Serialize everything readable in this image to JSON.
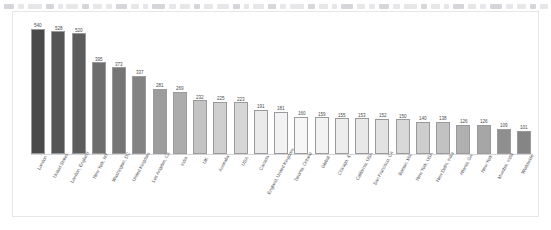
{
  "toolbar": {
    "ghost_segments": [
      {
        "x": 4,
        "w": 10
      },
      {
        "x": 18,
        "w": 6
      },
      {
        "x": 28,
        "w": 14
      },
      {
        "x": 46,
        "w": 8
      },
      {
        "x": 58,
        "w": 5
      },
      {
        "x": 66,
        "w": 12
      },
      {
        "x": 82,
        "w": 7
      },
      {
        "x": 93,
        "w": 9
      },
      {
        "x": 106,
        "w": 6
      },
      {
        "x": 116,
        "w": 11
      },
      {
        "x": 131,
        "w": 8
      },
      {
        "x": 143,
        "w": 5
      },
      {
        "x": 152,
        "w": 13
      },
      {
        "x": 169,
        "w": 7
      },
      {
        "x": 180,
        "w": 10
      },
      {
        "x": 194,
        "w": 6
      },
      {
        "x": 204,
        "w": 9
      },
      {
        "x": 217,
        "w": 12
      },
      {
        "x": 233,
        "w": 7
      },
      {
        "x": 244,
        "w": 5
      },
      {
        "x": 253,
        "w": 11
      },
      {
        "x": 268,
        "w": 8
      },
      {
        "x": 280,
        "w": 6
      },
      {
        "x": 290,
        "w": 14
      },
      {
        "x": 308,
        "w": 7
      },
      {
        "x": 319,
        "w": 9
      },
      {
        "x": 332,
        "w": 5
      },
      {
        "x": 341,
        "w": 12
      },
      {
        "x": 357,
        "w": 8
      },
      {
        "x": 369,
        "w": 6
      },
      {
        "x": 379,
        "w": 10
      },
      {
        "x": 393,
        "w": 7
      },
      {
        "x": 404,
        "w": 13
      },
      {
        "x": 421,
        "w": 6
      },
      {
        "x": 431,
        "w": 9
      },
      {
        "x": 444,
        "w": 5
      },
      {
        "x": 453,
        "w": 11
      },
      {
        "x": 468,
        "w": 8
      },
      {
        "x": 480,
        "w": 6
      },
      {
        "x": 490,
        "w": 12
      },
      {
        "x": 506,
        "w": 7
      },
      {
        "x": 517,
        "w": 9
      },
      {
        "x": 530,
        "w": 6
      },
      {
        "x": 540,
        "w": 8
      }
    ]
  },
  "chart_data": {
    "type": "bar",
    "title": "",
    "subtitle": "",
    "xlabel": "",
    "ylabel": "",
    "ylim": [
      0,
      560
    ],
    "grid": false,
    "legend": null,
    "orientation": "vertical",
    "value_labels_shown": true,
    "sort": "descending",
    "categories": [
      "London",
      "United States",
      "London, England",
      "New York, NY",
      "Washington, DC",
      "United Kingdom",
      "Los Angeles, CA",
      "India",
      "UK",
      "Australia",
      "USA",
      "Canada",
      "England, United Kingdom",
      "Toronto, Ontario",
      "Global",
      "Chicago, IL",
      "California, USA",
      "San Francisco, CA",
      "Boston, MA",
      "New York, USA",
      "New Delhi, India",
      "Atlanta, GA",
      "New York",
      "Mumbai, India",
      "Worldwide"
    ],
    "values": [
      540,
      528,
      520,
      395,
      373,
      337,
      281,
      269,
      232,
      225,
      223,
      191,
      181,
      160,
      159,
      155,
      153,
      152,
      150,
      140,
      138,
      126,
      126,
      109,
      101
    ],
    "bar_colors": [
      "#4a4a4a",
      "#555555",
      "#5d5d5d",
      "#6d6d6d",
      "#757575",
      "#838383",
      "#9c9c9c",
      "#acacac",
      "#c4c4c4",
      "#cfcfcf",
      "#d6d6d6",
      "#eaeaea",
      "#f2f2f2",
      "#f6f6f6",
      "#f2f2f2",
      "#ededed",
      "#e8e8e8",
      "#e2e2e2",
      "#d8d8d8",
      "#cdcdcd",
      "#c2c2c2",
      "#b0b0b0",
      "#a6a6a6",
      "#8f8f8f",
      "#858585"
    ]
  }
}
